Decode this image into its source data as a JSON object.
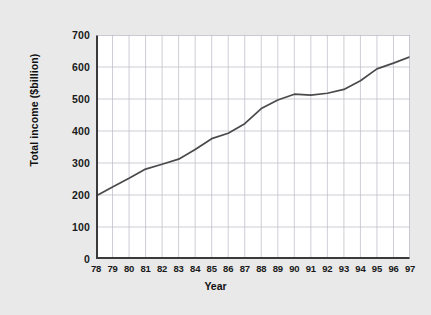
{
  "figure": {
    "background_color": "#e9e9e9",
    "plot_background_color": "#ffffff",
    "line_color": "#4a4a4a",
    "grid_color": "#b9b9c4",
    "axis_color": "#3a3a3a"
  },
  "chart_data": {
    "type": "line",
    "title": "",
    "xlabel": "Year",
    "ylabel": "Total income ($billion)",
    "categories": [
      "78",
      "79",
      "80",
      "81",
      "82",
      "83",
      "84",
      "85",
      "86",
      "87",
      "88",
      "89",
      "90",
      "91",
      "92",
      "93",
      "94",
      "95",
      "96",
      "97"
    ],
    "values": [
      197,
      225,
      252,
      281,
      296,
      312,
      342,
      376,
      393,
      423,
      470,
      497,
      515,
      512,
      518,
      530,
      557,
      594,
      612,
      632
    ],
    "xlim": [
      78,
      97
    ],
    "ylim": [
      0,
      700
    ],
    "yticks": [
      0,
      100,
      200,
      300,
      400,
      500,
      600,
      700
    ],
    "ytick_labels": [
      "0",
      "100",
      "200",
      "300",
      "400",
      "500",
      "600",
      "700"
    ],
    "xtick_labels": [
      "78",
      "79",
      "80",
      "81",
      "82",
      "83",
      "84",
      "85",
      "86",
      "87",
      "88",
      "89",
      "90",
      "91",
      "92",
      "93",
      "94",
      "95",
      "96",
      "97"
    ],
    "grid": true,
    "legend": null,
    "series": [
      {
        "name": "Total income",
        "values": [
          197,
          225,
          252,
          281,
          296,
          312,
          342,
          376,
          393,
          423,
          470,
          497,
          515,
          512,
          518,
          530,
          557,
          594,
          612,
          632
        ]
      }
    ]
  }
}
